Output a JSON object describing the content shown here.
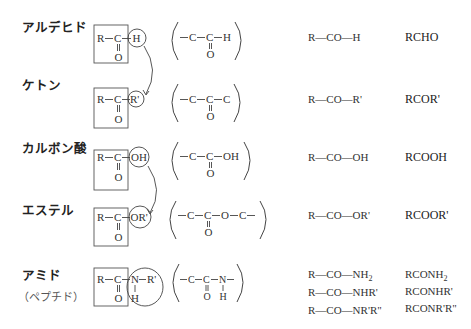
{
  "rows": [
    {
      "id": "aldehyde",
      "name": "アルデヒド",
      "boxed": {
        "r": "R",
        "c": "C",
        "o": "O",
        "circled": "H"
      },
      "partial": {
        "left": "C",
        "center": "C",
        "right": "H",
        "below": "O"
      },
      "formula": "R—CO—H",
      "abbr": "RCHO"
    },
    {
      "id": "ketone",
      "name": "ケトン",
      "boxed": {
        "r": "R",
        "c": "C",
        "o": "O",
        "circled": "R'"
      },
      "partial": {
        "left": "C",
        "center": "C",
        "right": "C",
        "below": "O"
      },
      "formula": "R—CO—R'",
      "abbr": "RCOR'"
    },
    {
      "id": "carboxylic-acid",
      "name": "カルボン酸",
      "boxed": {
        "r": "R",
        "c": "C",
        "o": "O",
        "circled": "OH"
      },
      "partial": {
        "left": "C",
        "center": "C",
        "right": "OH",
        "below": "O"
      },
      "formula": "R—CO—OH",
      "abbr": "RCOOH"
    },
    {
      "id": "ester",
      "name": "エステル",
      "boxed": {
        "r": "R",
        "c": "C",
        "o": "O",
        "circled": "OR'"
      },
      "partial": {
        "left": "C",
        "center": "C",
        "mid": "O",
        "right": "C",
        "below": "O"
      },
      "formula": "R—CO—OR'",
      "abbr": "RCOOR'"
    },
    {
      "id": "amide",
      "name": "アミド",
      "subname": "（ペプチド）",
      "boxed": {
        "r": "R",
        "c": "C",
        "o": "O",
        "n": "N",
        "rp": "R'",
        "h": "H"
      },
      "partial": {
        "left": "C",
        "center": "C",
        "right": "N",
        "below": "O",
        "below_n": "H"
      },
      "formulas": [
        "R—CO—NH",
        "R—CO—NHR'",
        "R—CO—NR'R\""
      ],
      "formula_subscript": "2",
      "abbrs": [
        "RCONH",
        "RCONHR'",
        "RCONR'R\""
      ],
      "abbr_subscript": "2"
    }
  ]
}
